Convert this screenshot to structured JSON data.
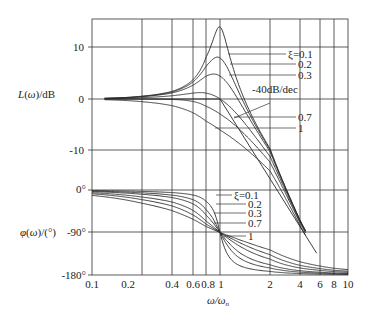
{
  "chart_data": [
    {
      "type": "line",
      "title": "",
      "panel": "magnitude",
      "ylabel": "L(ω)/dB",
      "xlabel": "ω/ωn",
      "xscale": "log",
      "xlim": [
        0.1,
        10
      ],
      "ylim": [
        -35,
        15
      ],
      "yticks": [
        10,
        0,
        -10
      ],
      "ytick_labels": [
        "10",
        "0",
        "-10"
      ],
      "grid": true,
      "series": [
        {
          "name": "ξ=0.1",
          "zeta": 0.1
        },
        {
          "name": "0.2",
          "zeta": 0.2
        },
        {
          "name": "0.3",
          "zeta": 0.3
        },
        {
          "name": "0.5",
          "zeta": 0.5
        },
        {
          "name": "0.7",
          "zeta": 0.7
        },
        {
          "name": "1",
          "zeta": 1.0
        }
      ],
      "annotations": [
        "ξ=0.1",
        "0.2",
        "0.3",
        "-40dB/dec",
        "0.7",
        "1"
      ],
      "asymptote": {
        "label": "-40dB/dec",
        "from_x": 1,
        "slope_db_per_decade": -40
      }
    },
    {
      "type": "line",
      "title": "",
      "panel": "phase",
      "ylabel": "φ(ω)/(°)",
      "xlabel": "ω/ωn",
      "xscale": "log",
      "xlim": [
        0.1,
        10
      ],
      "ylim": [
        -180,
        0
      ],
      "yticks": [
        0,
        -90,
        -180
      ],
      "ytick_labels": [
        "0°",
        "-90°",
        "-180°"
      ],
      "grid": true,
      "series": [
        {
          "name": "ξ=0.1",
          "zeta": 0.1
        },
        {
          "name": "0.2",
          "zeta": 0.2
        },
        {
          "name": "0.3",
          "zeta": 0.3
        },
        {
          "name": "0.5",
          "zeta": 0.5
        },
        {
          "name": "0.7",
          "zeta": 0.7
        },
        {
          "name": "1",
          "zeta": 1.0
        }
      ],
      "annotations": [
        "ξ=0.1",
        "0.2",
        "0.3",
        "0.7",
        "1"
      ]
    }
  ],
  "axes": {
    "x_ticks": [
      0.1,
      0.2,
      0.4,
      0.6,
      0.8,
      1,
      2,
      4,
      6,
      8,
      10
    ],
    "x_tick_labels": [
      "0.1",
      "0.2",
      "0.4",
      "0.6",
      "0.8",
      "1",
      "2",
      "4",
      "6",
      "8",
      "10"
    ],
    "xlabel": "ω/ω",
    "xlabel_sub": "n",
    "mag_ylabel": "L(ω)/dB",
    "phase_ylabel": "φ(ω)/(°)"
  },
  "labels": {
    "mag": [
      {
        "text": "ξ=0.1",
        "zeta": 0.1
      },
      {
        "text": "0.2",
        "zeta": 0.2
      },
      {
        "text": "0.3",
        "zeta": 0.3
      },
      {
        "text": "-40dB/dec",
        "zeta": null
      },
      {
        "text": "0.7",
        "zeta": 0.7
      },
      {
        "text": "1",
        "zeta": 1.0
      }
    ],
    "phase": [
      {
        "text": "ξ=0.1",
        "zeta": 0.1
      },
      {
        "text": "0.2",
        "zeta": 0.2
      },
      {
        "text": "0.3",
        "zeta": 0.3
      },
      {
        "text": "0.7",
        "zeta": 0.7
      },
      {
        "text": "1",
        "zeta": 1.0
      }
    ]
  },
  "ytick_text": {
    "mag": [
      "10",
      "0",
      "-10"
    ],
    "phase": [
      "0°",
      "-90°",
      "-180°"
    ]
  }
}
